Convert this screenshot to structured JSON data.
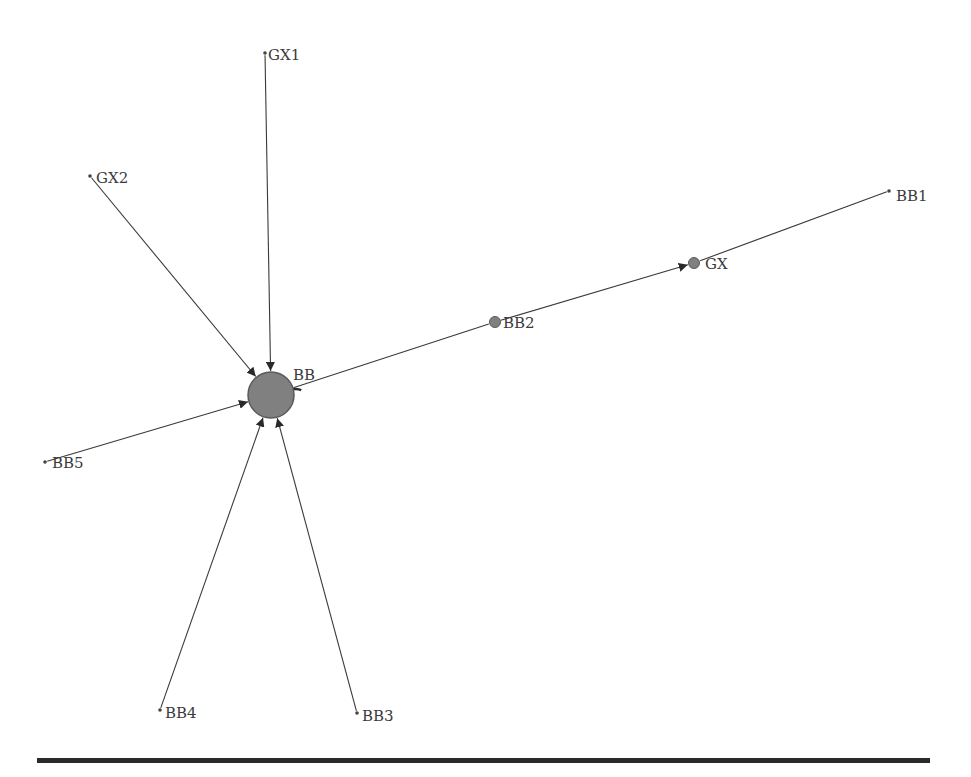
{
  "diagram": {
    "type": "directed-network",
    "colors": {
      "edge": "#3a3a3a",
      "node_fill": "#808080",
      "node_stroke": "#5a5a5a",
      "label": "#3a3a3a",
      "divider": "#2a2a2a"
    },
    "nodes": [
      {
        "id": "BB",
        "label": "BB",
        "x": 271,
        "y": 395,
        "r": 23,
        "lx": 293,
        "ly": 380
      },
      {
        "id": "GX1",
        "label": "GX1",
        "x": 265,
        "y": 53,
        "r": 1.8,
        "lx": 268,
        "ly": 60
      },
      {
        "id": "GX2",
        "label": "GX2",
        "x": 90,
        "y": 176,
        "r": 1.8,
        "lx": 96,
        "ly": 183
      },
      {
        "id": "BB1",
        "label": "BB1",
        "x": 889,
        "y": 191,
        "r": 1.8,
        "lx": 896,
        "ly": 201
      },
      {
        "id": "GX",
        "label": "GX",
        "x": 694,
        "y": 263,
        "r": 5.5,
        "lx": 705,
        "ly": 269
      },
      {
        "id": "BB2",
        "label": "BB2",
        "x": 495,
        "y": 322,
        "r": 5.5,
        "lx": 503,
        "ly": 328
      },
      {
        "id": "BB5",
        "label": "BB5",
        "x": 45,
        "y": 462,
        "r": 1.8,
        "lx": 52,
        "ly": 468
      },
      {
        "id": "BB4",
        "label": "BB4",
        "x": 160,
        "y": 710,
        "r": 1.8,
        "lx": 165,
        "ly": 718
      },
      {
        "id": "BB3",
        "label": "BB3",
        "x": 357,
        "y": 713,
        "r": 1.8,
        "lx": 362,
        "ly": 721
      }
    ],
    "edges": [
      {
        "from": "GX1",
        "to": "BB",
        "arrow": true
      },
      {
        "from": "GX2",
        "to": "BB",
        "arrow": true
      },
      {
        "from": "BB5",
        "to": "BB",
        "arrow": true
      },
      {
        "from": "BB4",
        "to": "BB",
        "arrow": true
      },
      {
        "from": "BB3",
        "to": "BB",
        "arrow": true
      },
      {
        "from": "BB",
        "to": "BB2",
        "arrow": false
      },
      {
        "from": "BB2",
        "to": "GX",
        "arrow": true
      },
      {
        "from": "BB1",
        "to": "GX",
        "arrow": false
      }
    ],
    "self_loop": {
      "node": "BB",
      "arrow": true
    }
  }
}
